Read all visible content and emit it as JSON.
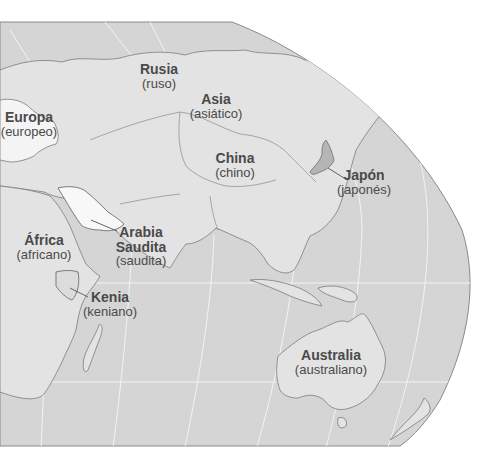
{
  "map": {
    "colors": {
      "ocean": "#d6d6d6",
      "land": "#e2e2e2",
      "highlight_light": "#f4f4f4",
      "highlight_dark": "#b4b4b4",
      "border": "#7a7a7a",
      "graticule": "#f2f2f2",
      "label": "#4a4a4a"
    },
    "labels": [
      {
        "id": "rusia",
        "name": "Rusia",
        "adj": "(ruso)"
      },
      {
        "id": "asia",
        "name": "Asia",
        "adj": "(asiático)"
      },
      {
        "id": "europa",
        "name": "Europa",
        "adj": "(europeo)"
      },
      {
        "id": "china",
        "name": "China",
        "adj": "(chino)"
      },
      {
        "id": "japon",
        "name": "Japón",
        "adj": "(japonés)"
      },
      {
        "id": "africa",
        "name": "África",
        "adj": "(africano)"
      },
      {
        "id": "arabia",
        "name": "Arabia Saudita",
        "name_line1": "Arabia",
        "name_line2": "Saudita",
        "adj": "(saudita)"
      },
      {
        "id": "kenia",
        "name": "Kenia",
        "adj": "(keniano)"
      },
      {
        "id": "australia",
        "name": "Australia",
        "adj": "(australiano)"
      }
    ]
  }
}
